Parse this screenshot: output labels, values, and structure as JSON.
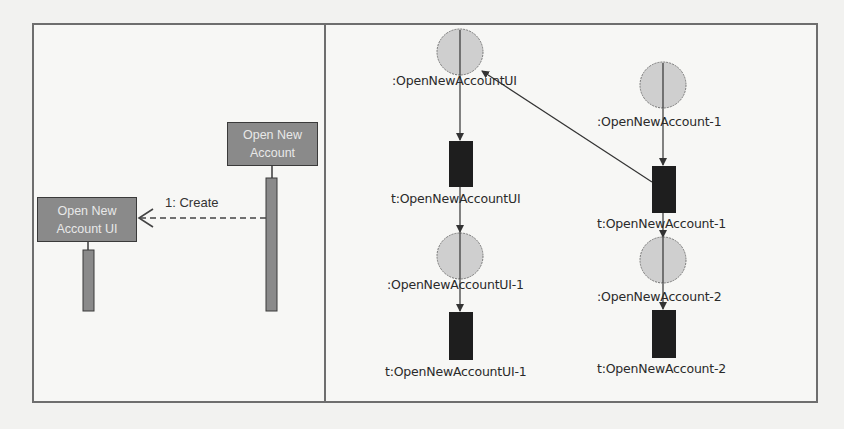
{
  "left_panel": {
    "title": "Sequence diagram",
    "lifelines": [
      {
        "name": "Open New Account",
        "line1": "Open New",
        "line2": "Account"
      },
      {
        "name": "Open New Account UI",
        "line1": "Open New",
        "line2": "Account UI"
      }
    ],
    "messages": [
      {
        "label": "1: Create",
        "from": "Open New Account",
        "to": "Open New Account UI",
        "style": "dashed"
      }
    ]
  },
  "right_panel": {
    "title": "Petri net",
    "places": [
      {
        "id": "p1",
        "label": ":OpenNewAccountUI"
      },
      {
        "id": "p2",
        "label": ":OpenNewAccountUI-1"
      },
      {
        "id": "p3",
        "label": ":OpenNewAccount-1"
      },
      {
        "id": "p4",
        "label": ":OpenNewAccount-2"
      }
    ],
    "transitions": [
      {
        "id": "t1",
        "label": "t:OpenNewAccountUI"
      },
      {
        "id": "t2",
        "label": "t:OpenNewAccountUI-1"
      },
      {
        "id": "t3",
        "label": "t:OpenNewAccount-1"
      },
      {
        "id": "t4",
        "label": "t:OpenNewAccount-2"
      }
    ],
    "arcs": [
      {
        "from": "p1",
        "to": "t1"
      },
      {
        "from": "t1",
        "to": "p2"
      },
      {
        "from": "p2",
        "to": "t2"
      },
      {
        "from": "p3",
        "to": "t3"
      },
      {
        "from": "t3",
        "to": "p4"
      },
      {
        "from": "p4",
        "to": "t4"
      },
      {
        "from": "t3",
        "to": "p1"
      }
    ]
  },
  "colors": {
    "frame": "#6e6e6e",
    "object_box": "#8a8a8a",
    "place_fill": "#cfcfcf",
    "transition_fill": "#1e1e1e"
  }
}
